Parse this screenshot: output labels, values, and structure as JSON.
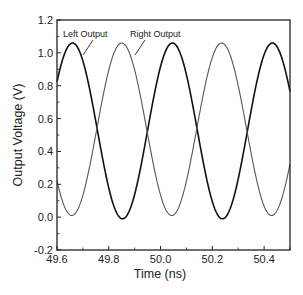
{
  "chart_data": {
    "type": "line",
    "title": "",
    "xlabel": "Time (ns)",
    "ylabel": "Output Voltage (V)",
    "xlim": [
      49.6,
      50.5
    ],
    "ylim": [
      -0.2,
      1.2
    ],
    "xticks": [
      "49.6",
      "49.8",
      "50.0",
      "50.2",
      "50.4"
    ],
    "yticks": [
      "-0.2",
      "0.0",
      "0.2",
      "0.4",
      "0.6",
      "0.8",
      "1.0",
      "1.2"
    ],
    "grid": false,
    "legend": "annotations",
    "annotations": [
      {
        "text": "Left Output",
        "points_to": "Left Output"
      },
      {
        "text": "Right Output",
        "points_to": "Right Output"
      }
    ],
    "series": [
      {
        "name": "Left Output",
        "color": "#111111",
        "amplitude": 0.535,
        "offset": 0.525,
        "period_ns": 0.386,
        "peak_times_ns": [
          49.66,
          50.05,
          50.43
        ],
        "trough_times_ns": [
          49.85,
          50.24
        ],
        "peak_v": 1.06,
        "trough_v": -0.01
      },
      {
        "name": "Right Output",
        "color": "#555555",
        "amplitude": 0.525,
        "offset": 0.535,
        "period_ns": 0.386,
        "peak_times_ns": [
          49.85,
          50.24
        ],
        "trough_times_ns": [
          49.66,
          50.05,
          50.43
        ],
        "peak_v": 1.06,
        "trough_v": 0.01
      }
    ]
  }
}
